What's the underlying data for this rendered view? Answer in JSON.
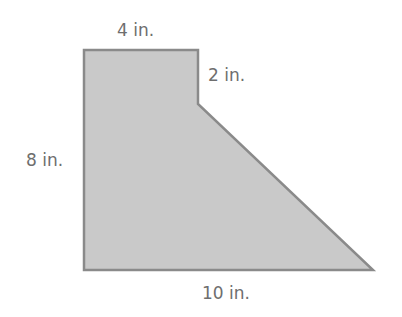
{
  "diagram": {
    "type": "composite-polygon",
    "shape": {
      "fill": "#c9c9c9",
      "stroke": "#8a8a8a",
      "points": "84,50 198,50 198,104 373,270 84,270"
    },
    "labels": {
      "top": "4 in.",
      "notch_side": "2 in.",
      "left": "8 in.",
      "bottom": "10 in."
    }
  }
}
